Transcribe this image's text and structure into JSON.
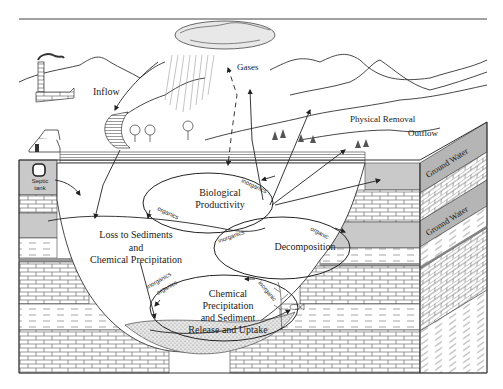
{
  "diagram": {
    "labels": {
      "inflow": "Inflow",
      "gases": "Gases",
      "physical_removal": "Physical Removal",
      "outflow": "Outflow",
      "septic_tank_line1": "Septic",
      "septic_tank_line2": "tank",
      "ground_water_upper": "Ground Water",
      "ground_water_lower": "Gronnd Water"
    },
    "processes": {
      "biological_productivity": [
        "Biological",
        "Productivity"
      ],
      "decomposition": [
        "Decomposition"
      ],
      "loss_to_sediments": [
        "Loss to Sediments",
        "and",
        "Chemical Precipitation"
      ],
      "chemical_precipitation": [
        "Chemical",
        "Precipitation",
        "and Sediment",
        "Release and Uptake"
      ]
    },
    "flow_labels": {
      "bio_inorganics": "inorganics",
      "bio_organics": "organics",
      "decomp_inorganics": "inorganics",
      "decomp_organic": "organic",
      "chem_inorganics": "inorganics",
      "chem_organics": "organics",
      "chem_inorganic": "inorganic"
    }
  }
}
